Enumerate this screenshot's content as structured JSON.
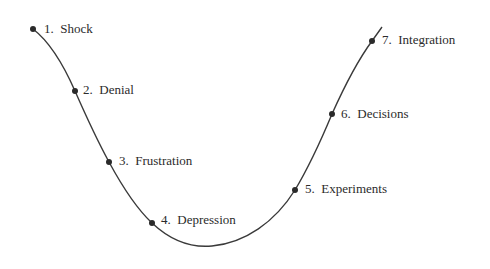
{
  "diagram": {
    "type": "change-curve",
    "line_color": "#3a3a3a",
    "dot_color": "#2a2a2a",
    "stages": [
      {
        "number": "1.",
        "name": "Shock",
        "dot": [
          33,
          29
        ],
        "label_pos": [
          44,
          29
        ]
      },
      {
        "number": "2.",
        "name": "Denial",
        "dot": [
          75,
          91
        ],
        "label_pos": [
          83,
          90
        ]
      },
      {
        "number": "3.",
        "name": "Frustration",
        "dot": [
          109,
          162
        ],
        "label_pos": [
          119,
          161
        ]
      },
      {
        "number": "4.",
        "name": "Depression",
        "dot": [
          152,
          223
        ],
        "label_pos": [
          161,
          220
        ]
      },
      {
        "number": "5.",
        "name": "Experiments",
        "dot": [
          295,
          190
        ],
        "label_pos": [
          305,
          189
        ]
      },
      {
        "number": "6.",
        "name": "Decisions",
        "dot": [
          332,
          114
        ],
        "label_pos": [
          341,
          114
        ]
      },
      {
        "number": "7.",
        "name": "Integration",
        "dot": [
          372,
          41
        ],
        "label_pos": [
          382,
          40
        ]
      }
    ],
    "labels": {
      "s1": "1.  Shock",
      "s2": "2.  Denial",
      "s3": "3.  Frustration",
      "s4": "4.  Depression",
      "s5": "5.  Experiments",
      "s6": "6.  Decisions",
      "s7": "7.  Integration"
    }
  }
}
